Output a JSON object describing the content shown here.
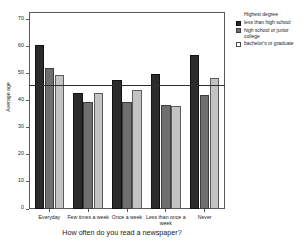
{
  "chart_data": {
    "type": "bar",
    "title": "",
    "xlabel": "How often do you read a newspaper?",
    "ylabel": "Average age",
    "categories": [
      "Everyday",
      "Few times a week",
      "Once a week",
      "Less than once a week",
      "Never"
    ],
    "series": [
      {
        "name": "less than high school",
        "color": "#2b2b2b",
        "values": [
          60.5,
          43.0,
          47.8,
          49.8,
          57.0
        ]
      },
      {
        "name": "high school or junior college",
        "color": "#6f6f6f",
        "values": [
          52.0,
          39.6,
          39.5,
          38.5,
          42.0
        ]
      },
      {
        "name": "bachelor's or graduate",
        "color": "#c3c3c3",
        "values": [
          49.7,
          43.0,
          44.0,
          38.2,
          48.3
        ]
      }
    ],
    "ylim": [
      0,
      72.5
    ],
    "yticks": [
      0,
      10,
      20,
      30,
      40,
      50,
      60,
      70
    ],
    "ytick_labels": [
      "0",
      "10",
      "20",
      "30",
      "40",
      "50",
      "60",
      "70"
    ],
    "reference_line": {
      "value": 46.0,
      "color": "#2e2e2e"
    },
    "grid": false,
    "legend": {
      "position": "right",
      "title": "Highest degree",
      "entries": [
        "less than high school",
        "high school or junior college",
        "bachelor's or graduate"
      ]
    }
  }
}
